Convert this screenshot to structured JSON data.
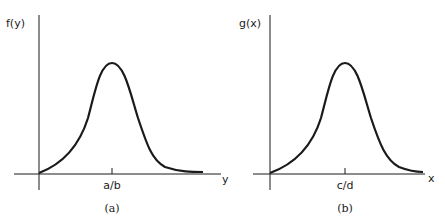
{
  "panels": [
    {
      "id": "a",
      "y_label": "f(y)",
      "x_label": "y",
      "tick_label": "a/b",
      "caption": "(a)"
    },
    {
      "id": "b",
      "y_label": "g(x)",
      "x_label": "x",
      "tick_label": "c/d",
      "caption": "(b)"
    }
  ],
  "colors": {
    "ink": "#1a1a1a",
    "background": "#ffffff"
  }
}
